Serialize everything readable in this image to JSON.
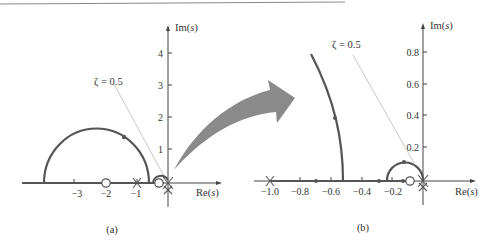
{
  "figure": {
    "panel_a": {
      "caption": "(a)",
      "x_axis_label_pre": "Re(",
      "x_axis_label_var": "s",
      "x_axis_label_post": ")",
      "y_axis_label_pre": "Im(",
      "y_axis_label_var": "s",
      "y_axis_label_post": ")",
      "x_ticks": [
        "−3",
        "−2",
        "−1"
      ],
      "y_ticks": [
        "1",
        "2",
        "3",
        "4"
      ],
      "zeta_label": "ζ = 0.5"
    },
    "panel_b": {
      "caption": "(b)",
      "x_axis_label_pre": "Re(",
      "x_axis_label_var": "s",
      "x_axis_label_post": ")",
      "y_axis_label_pre": "Im(",
      "y_axis_label_var": "s",
      "y_axis_label_post": ")",
      "x_ticks": [
        "−1.0",
        "−0.8",
        "−0.6",
        "−0.4",
        "−0.2"
      ],
      "y_ticks": [
        "0.2",
        "0.4",
        "0.6",
        "0.8"
      ],
      "zeta_label": "ζ = 0.5"
    },
    "colors": {
      "locus": "#555555",
      "axis": "#444444",
      "arrow": "#8a8a8a",
      "zeta_line": "#c8c8c8",
      "top_rule": "#888888"
    }
  }
}
